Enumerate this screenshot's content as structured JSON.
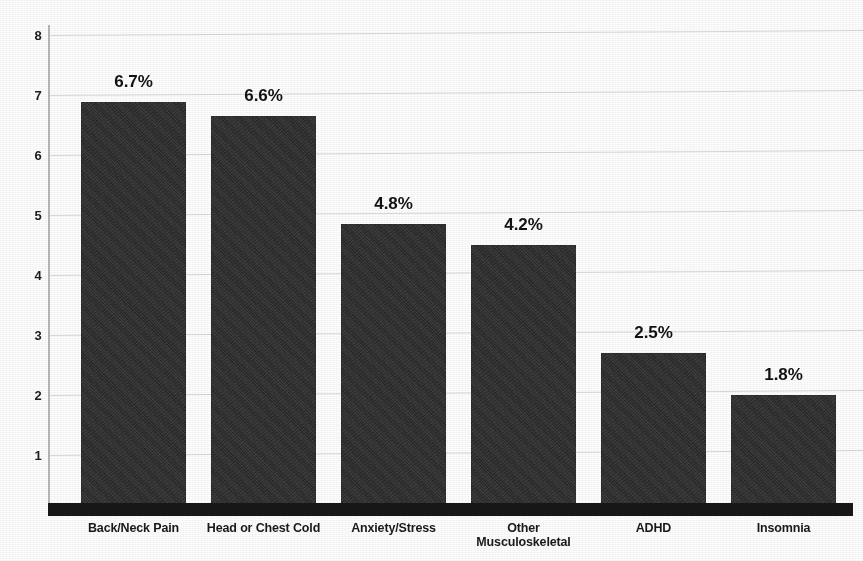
{
  "chart_data": {
    "type": "bar",
    "title": "",
    "subtitle": "",
    "xlabel": "",
    "ylabel": "",
    "categories": [
      "Back/Neck Pain",
      "Head or Chest Cold",
      "Anxiety/Stress",
      "Other\nMusculoskeletal",
      "ADHD",
      "Insomnia"
    ],
    "values": [
      6.7,
      6.6,
      4.8,
      4.2,
      2.5,
      1.8
    ],
    "bar_heights": [
      6.88,
      6.65,
      4.85,
      4.5,
      2.7,
      2.0
    ],
    "data_labels": [
      "6.7%",
      "6.6%",
      "4.8%",
      "4.2%",
      "2.5%",
      "1.8%"
    ],
    "ylim": [
      0,
      8
    ],
    "yticks": [
      8,
      7,
      6,
      5,
      4,
      3,
      2,
      1
    ],
    "ytick_labels": [
      "8",
      "7",
      "6",
      "5",
      "4",
      "3",
      "2",
      "1"
    ],
    "grid": true,
    "grid_axis": "y",
    "legend": false,
    "legend_position": "none",
    "bar_color": "#2b2b2b",
    "gridline_color": "#d9d9d9",
    "axis_color": "#171717",
    "background_color": "#ffffff"
  },
  "axis": {
    "y_tick_1": "1",
    "y_tick_2": "2",
    "y_tick_3": "3",
    "y_tick_4": "4",
    "y_tick_5": "5",
    "y_tick_6": "6",
    "y_tick_7": "7",
    "y_tick_8": "8"
  }
}
